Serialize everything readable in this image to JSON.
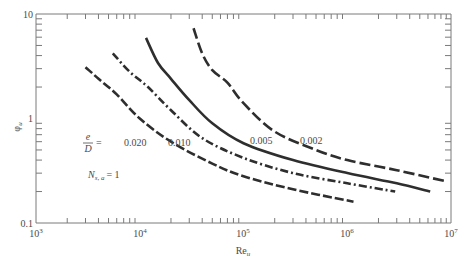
{
  "chart_data": {
    "type": "line",
    "title": "",
    "xlabel": "Re_u",
    "ylabel": "φ_u",
    "xscale": "log",
    "yscale": "log",
    "xlim": [
      1000,
      10000000
    ],
    "ylim": [
      0.1,
      10
    ],
    "grid": false,
    "x_tick_labels": [
      "10^3",
      "10^4",
      "10^5",
      "10^6",
      "10^7"
    ],
    "y_tick_labels": [
      "0.1",
      "1",
      "10"
    ],
    "annotations": [
      {
        "text": "e/D =",
        "note": "parameter label"
      },
      {
        "text": "N_{s,a} = 1"
      }
    ],
    "series": [
      {
        "name": "0.020",
        "style": "long-dash",
        "x": [
          3000,
          4000,
          6000,
          10000,
          20000,
          50000,
          100000,
          300000,
          1150000
        ],
        "y": [
          3.1,
          2.4,
          1.7,
          1.0,
          0.6,
          0.37,
          0.28,
          0.21,
          0.16
        ]
      },
      {
        "name": "0.010",
        "style": "dash-dot",
        "x": [
          5500,
          8000,
          12000,
          20000,
          40000,
          100000,
          300000,
          1000000,
          2900000
        ],
        "y": [
          4.2,
          2.8,
          2.0,
          1.2,
          0.65,
          0.42,
          0.3,
          0.24,
          0.2
        ]
      },
      {
        "name": "0.005",
        "style": "solid",
        "x": [
          11500,
          15000,
          20000,
          30000,
          50000,
          100000,
          300000,
          1000000,
          3000000,
          6300000
        ],
        "y": [
          5.9,
          3.4,
          2.4,
          1.5,
          0.9,
          0.58,
          0.4,
          0.3,
          0.24,
          0.2
        ]
      },
      {
        "name": "0.002",
        "style": "dash",
        "x": [
          33000,
          40000,
          50000,
          70000,
          100000,
          200000,
          500000,
          1000000,
          3000000,
          9000000
        ],
        "y": [
          7.3,
          4.2,
          2.9,
          2.2,
          1.4,
          0.75,
          0.5,
          0.4,
          0.32,
          0.25
        ]
      }
    ]
  },
  "axes": {
    "x_label": "Re",
    "x_label_sub": "u",
    "y_label": "φ",
    "y_label_sub": "u",
    "x_ticks": [
      "10",
      "10",
      "10",
      "10",
      "10"
    ],
    "x_ticks_exp": [
      "3",
      "4",
      "5",
      "6",
      "7"
    ],
    "y_ticks": [
      "0.1",
      "1",
      "10"
    ]
  },
  "annotations": {
    "ratio_num": "e",
    "ratio_den": "D",
    "ratio_eq": "=",
    "n_label": "N",
    "n_sub": "s, a",
    "n_eq": "= 1",
    "curve_labels": [
      "0.020",
      "0.010",
      "0.005",
      "0.002"
    ]
  }
}
